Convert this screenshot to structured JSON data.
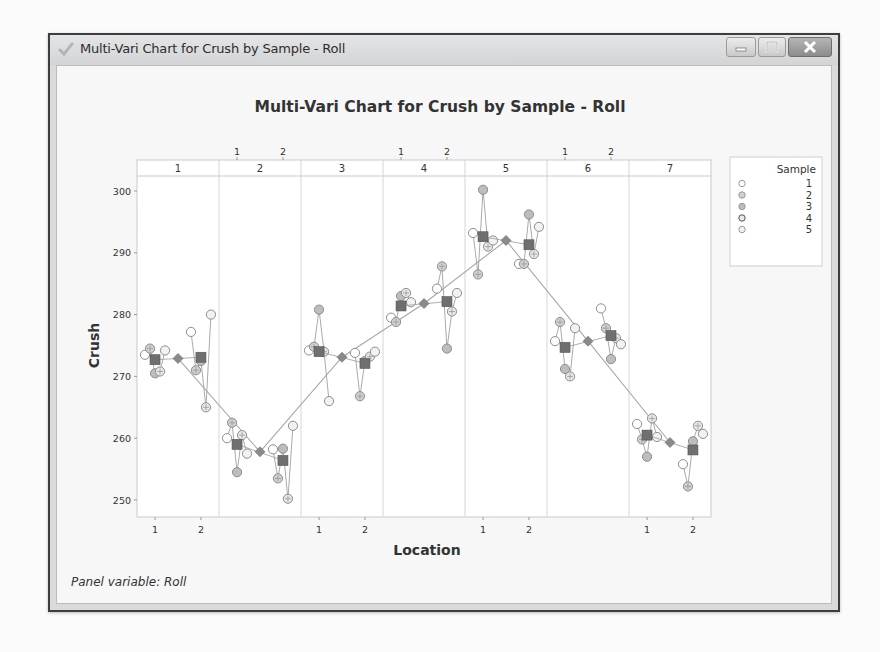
{
  "window": {
    "title": "Multi-Vari Chart for Crush by Sample - Roll",
    "buttons": [
      "minimize",
      "maximize",
      "close"
    ]
  },
  "chart": {
    "panel_note": "Panel variable: Roll"
  },
  "chart_data": {
    "type": "scatter",
    "subtype": "multi-vari",
    "title": "Multi-Vari Chart for Crush by Sample - Roll",
    "xlabel": "Location",
    "ylabel": "Crush",
    "ylim": [
      248,
      303
    ],
    "yticks": [
      250,
      260,
      270,
      280,
      290,
      300
    ],
    "panel_variable": "Roll",
    "panels": [
      "1",
      "2",
      "3",
      "4",
      "5",
      "6",
      "7"
    ],
    "x_categories": [
      "1",
      "2"
    ],
    "legend": {
      "title": "Sample",
      "entries": [
        "1",
        "2",
        "3",
        "4",
        "5"
      ]
    },
    "grid": false,
    "series": [
      {
        "roll": "1",
        "location": "1",
        "samples": [
          273.5,
          274.5,
          270.5,
          270.8,
          274.2
        ],
        "mean": 272.7
      },
      {
        "roll": "1",
        "location": "2",
        "samples": [
          277.2,
          271.0,
          272.5,
          265.0,
          280.0
        ],
        "mean": 273.1
      },
      {
        "roll": "2",
        "location": "1",
        "samples": [
          260.0,
          262.5,
          254.5,
          260.5,
          257.5
        ],
        "mean": 259.0
      },
      {
        "roll": "2",
        "location": "2",
        "samples": [
          258.2,
          253.5,
          258.3,
          250.2,
          262.0
        ],
        "mean": 256.4
      },
      {
        "roll": "3",
        "location": "1",
        "samples": [
          274.2,
          274.8,
          280.8,
          274.0,
          266.0
        ],
        "mean": 274.0
      },
      {
        "roll": "3",
        "location": "2",
        "samples": [
          273.8,
          266.8,
          272.5,
          273.2,
          274.0
        ],
        "mean": 272.1
      },
      {
        "roll": "4",
        "location": "1",
        "samples": [
          279.5,
          278.8,
          283.0,
          283.5,
          282.0
        ],
        "mean": 281.4
      },
      {
        "roll": "4",
        "location": "2",
        "samples": [
          284.2,
          287.8,
          274.5,
          280.5,
          283.5
        ],
        "mean": 282.1
      },
      {
        "roll": "5",
        "location": "1",
        "samples": [
          293.2,
          286.5,
          300.2,
          291.0,
          292.0
        ],
        "mean": 292.6
      },
      {
        "roll": "5",
        "location": "2",
        "samples": [
          288.2,
          288.2,
          296.2,
          289.8,
          294.2
        ],
        "mean": 291.3
      },
      {
        "roll": "6",
        "location": "1",
        "samples": [
          275.7,
          278.8,
          271.2,
          270.0,
          277.8
        ],
        "mean": 274.7
      },
      {
        "roll": "6",
        "location": "2",
        "samples": [
          281.0,
          277.8,
          272.8,
          276.2,
          275.2
        ],
        "mean": 276.6
      },
      {
        "roll": "7",
        "location": "1",
        "samples": [
          262.3,
          259.8,
          257.0,
          263.2,
          260.2
        ],
        "mean": 260.5
      },
      {
        "roll": "7",
        "location": "2",
        "samples": [
          255.8,
          252.2,
          259.5,
          262.0,
          260.7
        ],
        "mean": 258.1
      }
    ],
    "roll_means": [
      272.9,
      257.8,
      273.1,
      281.8,
      292.0,
      275.7,
      259.3
    ],
    "colors": {
      "location_mean": "#6f6f6f",
      "roll_mean": "#8a8a8a",
      "sample_marker": "#9a9a9a",
      "connect_line": "#9c9c9c"
    }
  }
}
